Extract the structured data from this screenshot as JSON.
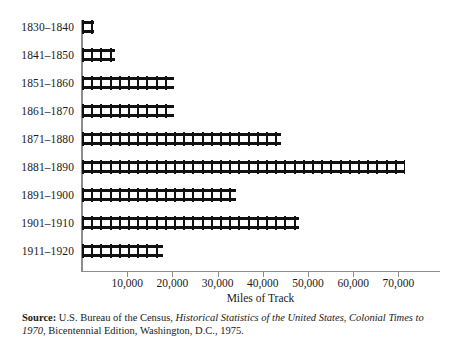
{
  "chart_data": {
    "type": "bar",
    "orientation": "horizontal",
    "title": "",
    "xlabel": "Miles of Track",
    "ylabel": "",
    "categories": [
      "1830–1840",
      "1841–1850",
      "1851–1860",
      "1861–1870",
      "1871–1880",
      "1881–1890",
      "1891–1900",
      "1901–1910",
      "1911–1920"
    ],
    "values": [
      2600,
      7300,
      20400,
      20400,
      44000,
      71500,
      34000,
      48000,
      18000
    ],
    "xlim": [
      0,
      79000
    ],
    "xticks": [
      10000,
      20000,
      30000,
      40000,
      50000,
      60000,
      70000
    ],
    "xtick_labels": [
      "10,000",
      "20,000",
      "30,000",
      "40,000",
      "50,000",
      "60,000",
      "70,000"
    ],
    "grid": false,
    "legend": null,
    "bar_style": "railroad-track",
    "colors": {
      "bar": "#111111",
      "axis": "#8d8d8d",
      "text": "#1a1a1a",
      "background": "#ffffff"
    }
  },
  "axis": {
    "x_label": "Miles of Track",
    "tick_labels": [
      "10,000",
      "20,000",
      "30,000",
      "40,000",
      "50,000",
      "60,000",
      "70,000"
    ]
  },
  "rows": [
    {
      "label": "1830–1840",
      "value": 2600
    },
    {
      "label": "1841–1850",
      "value": 7300
    },
    {
      "label": "1851–1860",
      "value": 20400
    },
    {
      "label": "1861–1870",
      "value": 20400
    },
    {
      "label": "1871–1880",
      "value": 44000
    },
    {
      "label": "1881–1890",
      "value": 71500
    },
    {
      "label": "1891–1900",
      "value": 34000
    },
    {
      "label": "1901–1910",
      "value": 48000
    },
    {
      "label": "1911–1920",
      "value": 18000
    }
  ],
  "source": {
    "lead": "Source:",
    "part1": " U.S. Bureau of the Census, ",
    "title_italic": "Historical Statistics of the United States, Colonial Times to 1970",
    "part2": ", Bicentennial Edition, Washington, D.C., 1975."
  }
}
